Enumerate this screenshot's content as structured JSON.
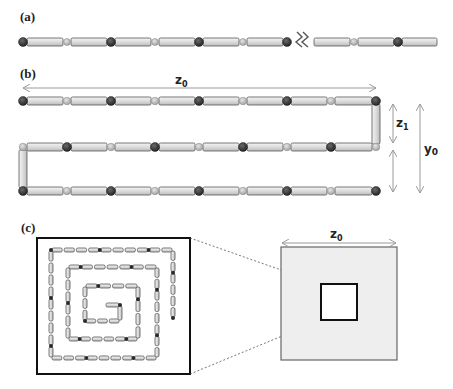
{
  "panels": {
    "a": {
      "label": "(a)"
    },
    "b": {
      "label": "(b)",
      "z0_label": "z",
      "z0_sub": "0",
      "z1_label": "z",
      "z1_sub": "1",
      "y0_label": "y",
      "y0_sub": "0"
    },
    "c": {
      "label": "(c)",
      "z0_label": "z",
      "z0_sub": "0"
    }
  },
  "colors": {
    "rod_fill": "#e2e2e2",
    "rod_stroke": "#555555",
    "dark_bead": "#2e2e2e",
    "light_bead": "#b8b8b8",
    "arrow": "#9a9a9a",
    "zoom_square_fill": "#eeeeee",
    "frame": "#111111"
  },
  "icons": {
    "break": "zigzag-break-icon"
  }
}
